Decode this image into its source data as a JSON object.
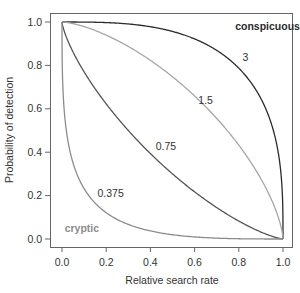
{
  "chart_data": {
    "type": "line",
    "title": "",
    "xlabel": "Relative search rate",
    "ylabel": "Probability of detection",
    "xlim": [
      0.0,
      1.0
    ],
    "ylim": [
      0.0,
      1.0
    ],
    "grid": false,
    "legend": "none (inline curve labels)",
    "x_ticks": [
      "0.0",
      "0.2",
      "0.4",
      "0.6",
      "0.8",
      "1.0"
    ],
    "y_ticks": [
      "0.0",
      "0.2",
      "0.4",
      "0.6",
      "0.8",
      "1.0"
    ],
    "formula": "y = (1 - x^p)^(1/p)",
    "series": [
      {
        "name": "3",
        "parameter": 3,
        "color": "#2b2b2b",
        "x": [
          0.0,
          0.2,
          0.4,
          0.6,
          0.8,
          0.9,
          1.0
        ],
        "values": [
          1.0,
          0.997,
          0.979,
          0.924,
          0.774,
          0.627,
          0.0
        ]
      },
      {
        "name": "1.5",
        "parameter": 1.5,
        "color": "#a6a6a6",
        "x": [
          0.0,
          0.2,
          0.4,
          0.6,
          0.8,
          0.9,
          1.0
        ],
        "values": [
          1.0,
          0.94,
          0.829,
          0.676,
          0.463,
          0.32,
          0.0
        ]
      },
      {
        "name": "0.75",
        "parameter": 0.75,
        "color": "#555555",
        "x": [
          0.0,
          0.2,
          0.4,
          0.6,
          0.8,
          0.9,
          1.0
        ],
        "values": [
          1.0,
          0.634,
          0.383,
          0.198,
          0.068,
          0.022,
          0.0
        ]
      },
      {
        "name": "0.375",
        "parameter": 0.375,
        "color": "#8c8c8c",
        "x": [
          0.0,
          0.2,
          0.4,
          0.6,
          0.8,
          0.9,
          1.0
        ],
        "values": [
          1.0,
          0.149,
          0.047,
          0.012,
          0.0013,
          0.0001,
          0.0
        ]
      }
    ],
    "annotations": [
      {
        "text": "conspicuous",
        "x": 0.93,
        "y": 0.98,
        "style": "bold",
        "color": "#2b2b2b"
      },
      {
        "text": "cryptic",
        "x": 0.09,
        "y": 0.05,
        "style": "bold",
        "color": "#8c8c8c"
      },
      {
        "text": "3",
        "x": 0.83,
        "y": 0.84
      },
      {
        "text": "1.5",
        "x": 0.65,
        "y": 0.64
      },
      {
        "text": "0.75",
        "x": 0.47,
        "y": 0.43
      },
      {
        "text": "0.375",
        "x": 0.22,
        "y": 0.21
      }
    ]
  }
}
